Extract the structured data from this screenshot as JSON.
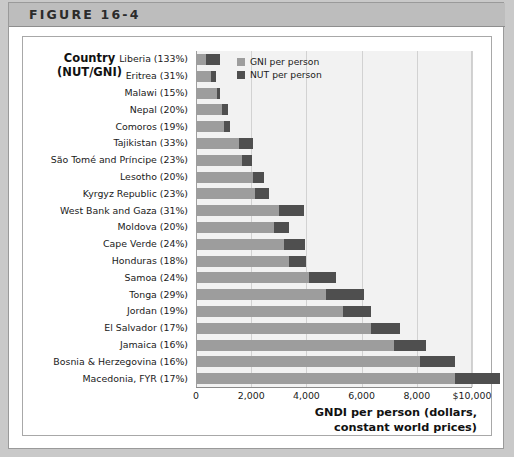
{
  "figure": {
    "header_label": "FIGURE 16-4"
  },
  "chart_data": {
    "type": "bar",
    "orientation": "horizontal",
    "stacked": true,
    "title": "",
    "xlabel": "GNDI per person (dollars, constant world prices)",
    "ylabel": "Country (NUT/GNI)",
    "ylabel_lines": [
      "Country",
      "(NUT/GNI)"
    ],
    "xlim": [
      0,
      10000
    ],
    "xticks": [
      0,
      2000,
      4000,
      6000,
      8000,
      10000
    ],
    "xtick_labels": [
      "0",
      "2,000",
      "4,000",
      "6,000",
      "8,000",
      "$10,000"
    ],
    "grid": true,
    "legend_position": "top-right",
    "categories": [
      "Liberia (133%)",
      "Eritrea (31%)",
      "Malawi (15%)",
      "Nepal (20%)",
      "Comoros (19%)",
      "Tajikistan (33%)",
      "São Tomé and Príncipe (23%)",
      "Lesotho (20%)",
      "Kyrgyz Republic (23%)",
      "West Bank and Gaza (31%)",
      "Moldova (20%)",
      "Cape Verde (24%)",
      "Honduras (18%)",
      "Samoa (24%)",
      "Tonga (29%)",
      "Jordan (19%)",
      "El Salvador (17%)",
      "Jamaica (16%)",
      "Bosnia & Herzegovina (16%)",
      "Macedonia, FYR (17%)"
    ],
    "series": [
      {
        "name": "GNI per person",
        "color": "#9d9d9d",
        "values": [
          370,
          550,
          760,
          960,
          1030,
          1560,
          1650,
          2050,
          2140,
          3000,
          2820,
          3180,
          3370,
          4100,
          4720,
          5330,
          6330,
          7190,
          8100,
          9400
        ]
      },
      {
        "name": "NUT per person",
        "color": "#4f4f4f",
        "values": [
          490,
          170,
          115,
          190,
          195,
          515,
          380,
          410,
          490,
          930,
          565,
          765,
          605,
          985,
          1370,
          1010,
          1075,
          1150,
          1300,
          1600
        ]
      }
    ],
    "legend": [
      {
        "label": "GNI per person",
        "color": "#9d9d9d"
      },
      {
        "label": "NUT per person",
        "color": "#4f4f4f"
      }
    ]
  }
}
